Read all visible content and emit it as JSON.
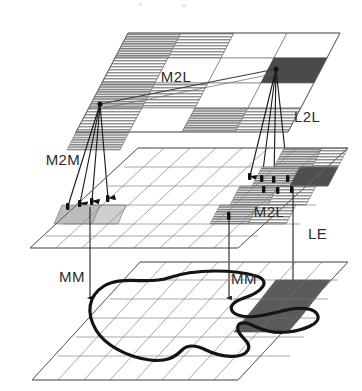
{
  "figure": {
    "width": 362,
    "height": 391,
    "background": "#ffffff"
  },
  "labels": {
    "top_plane_m2l": "M2L",
    "top_plane_l2l": "L2L",
    "middle_plane_m2m": "M2M",
    "middle_plane_m2l": "M2L",
    "middle_plane_le": "LE",
    "bottom_plane_mm_left": "MM",
    "bottom_plane_mm_right": "MM"
  },
  "label_positions": {
    "top_plane_m2l": {
      "x": 176,
      "y": 78
    },
    "top_plane_l2l": {
      "x": 294,
      "y": 118
    },
    "middle_plane_m2m": {
      "x": 63,
      "y": 161
    },
    "middle_plane_m2l": {
      "x": 269,
      "y": 213
    },
    "middle_plane_le": {
      "x": 312,
      "y": 235
    },
    "bottom_plane_mm_left": {
      "x": 72,
      "y": 278
    },
    "bottom_plane_mm_right": {
      "x": 244,
      "y": 280
    }
  },
  "planes": [
    {
      "name": "top-plane",
      "role": "layer-L",
      "grid_pattern": "checkerboard",
      "columns": 4,
      "rows": 4,
      "cell_fill_shaded": "#9a9a9a",
      "cell_fill_dark": "#4a4a4a",
      "cell_fill_light": "#ffffff",
      "stroke": "#767676",
      "corners": {
        "tl": [
          128,
          33
        ],
        "tr": [
          340,
          33
        ],
        "br": [
          240,
          132
        ],
        "bl": [
          32,
          132
        ]
      }
    },
    {
      "name": "middle-plane",
      "role": "layer-M",
      "grid_pattern": "fine-grid",
      "columns": 8,
      "rows": 6,
      "cell_fill_shaded": "#a8a8a8",
      "cell_fill_dark": "#4f4f4f",
      "stroke": "#6f6f6f",
      "corners": {
        "tl": [
          138,
          148
        ],
        "tr": [
          348,
          148
        ],
        "br": [
          238,
          248
        ],
        "bl": [
          30,
          248
        ]
      }
    },
    {
      "name": "bottom-plane",
      "role": "layer-MM",
      "grid_pattern": "fine-grid",
      "columns": 8,
      "rows": 6,
      "cell_fill_dark": "#5a5a5a",
      "stroke": "#6f6f6f",
      "has_contour": true,
      "corners": {
        "tl": [
          140,
          262
        ],
        "tr": [
          348,
          262
        ],
        "br": [
          238,
          380
        ],
        "bl": [
          32,
          380
        ]
      }
    }
  ],
  "connectors": {
    "left_fan": {
      "name": "m2m-fan",
      "origin": [
        100,
        104
      ],
      "endpoints": [
        [
          68,
          208
        ],
        [
          80,
          205
        ],
        [
          92,
          203
        ],
        [
          108,
          200
        ]
      ],
      "count": 4,
      "stroke": "#1c1c1c"
    },
    "right_fan": {
      "name": "l2l-fan",
      "origin": [
        276,
        69
      ],
      "endpoints": [
        [
          250,
          178
        ],
        [
          262,
          180
        ],
        [
          274,
          181
        ],
        [
          288,
          180
        ]
      ],
      "count": 4,
      "stroke": "#1c1c1c"
    },
    "cross_link": {
      "name": "m2l-cross-link",
      "from": [
        100,
        104
      ],
      "to": [
        276,
        69
      ],
      "stroke": "#3c3c3c"
    },
    "vertical_drops": [
      {
        "name": "mm-drop-left",
        "x": 90,
        "from": 208,
        "to": 300,
        "arrow": true
      },
      {
        "name": "mm-drop-mid",
        "x": 229,
        "from": 218,
        "to": 300,
        "arrow": true
      },
      {
        "name": "le-drop-right",
        "x": 293,
        "from": 188,
        "to": 296,
        "arrow": true
      }
    ]
  },
  "contour": {
    "name": "region-outline",
    "stroke": "#141414",
    "stroke_width": 3.2,
    "closed": true
  }
}
